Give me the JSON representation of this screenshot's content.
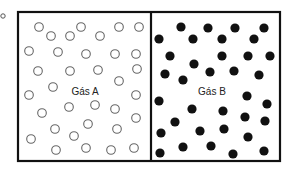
{
  "figure": {
    "marker": {
      "x": 3,
      "y": 16,
      "r": 2.2,
      "stroke": "#555555"
    },
    "container": {
      "x": 18,
      "y": 12,
      "width": 262,
      "height": 149,
      "stroke": "#111111",
      "stroke_width": 2.2,
      "divider_x": 151
    },
    "compartments": [
      {
        "name": "gas-a",
        "label": "Gás A",
        "label_x": 85,
        "label_y": 95,
        "particle_style": "hollow",
        "stroke": "#666666",
        "radius": 4.3,
        "particles": [
          [
            39,
            27
          ],
          [
            51,
            36
          ],
          [
            70,
            36
          ],
          [
            81,
            27
          ],
          [
            100,
            36
          ],
          [
            119,
            27
          ],
          [
            139,
            27
          ],
          [
            29,
            51
          ],
          [
            58,
            52
          ],
          [
            86,
            54
          ],
          [
            115,
            54
          ],
          [
            136,
            54
          ],
          [
            38,
            71
          ],
          [
            70,
            71
          ],
          [
            98,
            70
          ],
          [
            137,
            69
          ],
          [
            53,
            87
          ],
          [
            119,
            81
          ],
          [
            29,
            95
          ],
          [
            136,
            95
          ],
          [
            42,
            113
          ],
          [
            69,
            107
          ],
          [
            95,
            105
          ],
          [
            115,
            109
          ],
          [
            136,
            118
          ],
          [
            55,
            129
          ],
          [
            88,
            124
          ],
          [
            74,
            136
          ],
          [
            117,
            129
          ],
          [
            31,
            139
          ],
          [
            56,
            150
          ],
          [
            86,
            148
          ],
          [
            111,
            150
          ],
          [
            134,
            148
          ]
        ]
      },
      {
        "name": "gas-b",
        "label": "Gás B",
        "label_x": 212,
        "label_y": 95,
        "particle_style": "filled",
        "fill": "#111111",
        "radius": 4.6,
        "particles": [
          [
            181,
            27
          ],
          [
            208,
            28
          ],
          [
            235,
            28
          ],
          [
            264,
            28
          ],
          [
            159,
            39
          ],
          [
            193,
            39
          ],
          [
            222,
            39
          ],
          [
            254,
            39
          ],
          [
            170,
            56
          ],
          [
            222,
            56
          ],
          [
            248,
            56
          ],
          [
            270,
            56
          ],
          [
            194,
            64
          ],
          [
            165,
            74
          ],
          [
            210,
            72
          ],
          [
            234,
            71
          ],
          [
            259,
            75
          ],
          [
            183,
            80
          ],
          [
            247,
            96
          ],
          [
            159,
            101
          ],
          [
            267,
            104
          ],
          [
            192,
            109
          ],
          [
            223,
            111
          ],
          [
            245,
            117
          ],
          [
            175,
            122
          ],
          [
            265,
            121
          ],
          [
            161,
            133
          ],
          [
            200,
            131
          ],
          [
            224,
            129
          ],
          [
            248,
            137
          ],
          [
            183,
            147
          ],
          [
            211,
            146
          ],
          [
            160,
            153
          ],
          [
            233,
            154
          ],
          [
            264,
            151
          ]
        ]
      }
    ]
  }
}
